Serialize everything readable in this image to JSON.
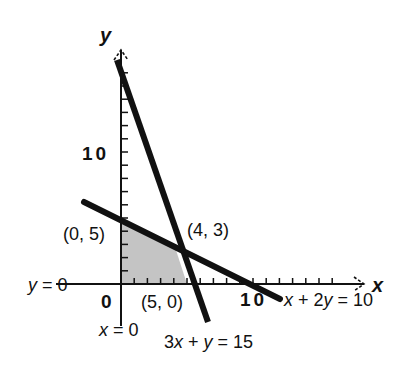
{
  "diagram": {
    "axes": {
      "x_label": "x",
      "y_label": "y",
      "origin_label": "0",
      "x_tick_label": "10",
      "y_tick_label": "10",
      "x_range": [
        0,
        19
      ],
      "y_range": [
        0,
        17
      ]
    },
    "lines": [
      {
        "name": "3x + y = 15",
        "label_parts": [
          "3",
          "x",
          " + ",
          "y",
          " = 15"
        ]
      },
      {
        "name": "x + 2y = 10",
        "label_parts": [
          "x",
          " + 2",
          "y",
          " = 10"
        ]
      },
      {
        "name": "x = 0",
        "label_parts": [
          "x",
          " = 0"
        ]
      },
      {
        "name": "y = 0",
        "label_parts": [
          "y",
          " = 0"
        ]
      }
    ],
    "points": [
      {
        "label": "(0, 5)",
        "x": 0,
        "y": 5
      },
      {
        "label": "(4, 3)",
        "x": 4,
        "y": 3
      },
      {
        "label": "(5, 0)",
        "x": 5,
        "y": 0
      }
    ],
    "shaded_region": {
      "vertices": [
        [
          0,
          0
        ],
        [
          0,
          5
        ],
        [
          4,
          3
        ],
        [
          5,
          0
        ]
      ],
      "fill": "#c8c8c8"
    },
    "colors": {
      "line": "#111111",
      "axis": "#111111",
      "region": "#c8c8c8"
    }
  }
}
